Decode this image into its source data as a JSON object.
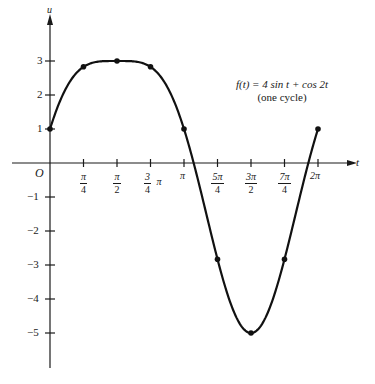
{
  "chart_data": {
    "type": "line",
    "title": "",
    "annotation": {
      "line1": "f(t) = 4 sin t + cos 2t",
      "line2": "(one cycle)"
    },
    "xlabel": "t",
    "ylabel": "u",
    "origin_label": "O",
    "xlim": [
      0,
      6.2832
    ],
    "ylim": [
      -5,
      3
    ],
    "grid": false,
    "x_ticks": [
      {
        "num": "π",
        "den": "4",
        "value": 0.7854
      },
      {
        "num": "π",
        "den": "2",
        "value": 1.5708
      },
      {
        "num": "3",
        "den": "4",
        "suffix": "π",
        "value": 2.3562
      },
      {
        "label": "π",
        "value": 3.1416
      },
      {
        "num": "5π",
        "den": "4",
        "value": 3.927
      },
      {
        "num": "3π",
        "den": "2",
        "value": 4.7124
      },
      {
        "num": "7π",
        "den": "4",
        "value": 5.4978
      },
      {
        "label": "2π",
        "value": 6.2832
      }
    ],
    "y_ticks": [
      "3",
      "2",
      "1",
      "−1",
      "−2",
      "−3",
      "−4",
      "−5"
    ],
    "y_tick_values": [
      3,
      2,
      1,
      -1,
      -2,
      -3,
      -4,
      -5
    ],
    "series": [
      {
        "name": "f(t) = 4 sin t + cos 2t",
        "marked_points": {
          "x": [
            "0",
            "π/4",
            "π/2",
            "3π/4",
            "π",
            "5π/4",
            "3π/2",
            "7π/4",
            "2π"
          ],
          "y": [
            1,
            2.83,
            3,
            2.83,
            1,
            -2.83,
            -5,
            -2.83,
            1
          ]
        }
      }
    ]
  }
}
